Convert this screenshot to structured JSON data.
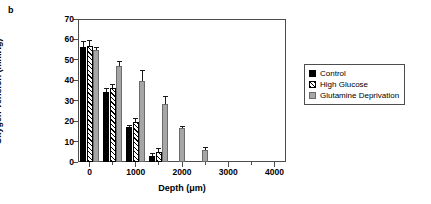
{
  "panel": {
    "label": "b"
  },
  "legend": {
    "position": "right",
    "entries": [
      {
        "label": "Control",
        "swatch": "solid-black-square-icon",
        "color": "#000000"
      },
      {
        "label": "High Glucose",
        "swatch": "hatched-square-icon",
        "color": "#ffffff"
      },
      {
        "label": "Glutamine Deprivation",
        "swatch": "gray-square-icon",
        "color": "#a6a6a6"
      }
    ]
  },
  "chart_data": {
    "type": "bar",
    "title": "",
    "subtitle": "",
    "xlabel": "Depth (μm)",
    "ylabel": "Oxygen Tension (mmHg)",
    "xlim": [
      -250,
      4250
    ],
    "ylim": [
      0,
      70
    ],
    "yticks": [
      0,
      10,
      20,
      30,
      40,
      50,
      60,
      70
    ],
    "ytick_labels": [
      "0",
      "10",
      "20",
      "30",
      "40",
      "50",
      "60",
      "70"
    ],
    "xticks": [
      0,
      1000,
      2000,
      3000,
      4000
    ],
    "xtick_labels": [
      "0",
      "1000",
      "2000",
      "3000",
      "4000"
    ],
    "xticks_minor": [
      500,
      1500,
      2500,
      3500
    ],
    "grid": false,
    "orientation": "vertical",
    "error_bars": "standard error",
    "categories": [
      0,
      500,
      1000,
      1500,
      2000,
      2500
    ],
    "category_labels": [
      "0",
      "500",
      "1000",
      "1500",
      "2000",
      "2500"
    ],
    "series": [
      {
        "name": "Control",
        "color": "#000000",
        "pattern": "solid",
        "values": [
          56.5,
          34.5,
          17.0,
          3.0,
          null,
          null
        ],
        "errors": [
          2.5,
          1.5,
          1.0,
          1.5,
          null,
          null
        ]
      },
      {
        "name": "High Glucose",
        "color": "#ffffff",
        "pattern": "diagonal-hatch",
        "values": [
          57.0,
          36.0,
          19.5,
          5.0,
          null,
          null
        ],
        "errors": [
          2.5,
          2.0,
          2.0,
          2.0,
          null,
          null
        ]
      },
      {
        "name": "Glutamine Deprivation",
        "color": "#a6a6a6",
        "pattern": "solid",
        "values": [
          55.0,
          47.0,
          39.5,
          28.5,
          16.5,
          6.0
        ],
        "errors": [
          1.5,
          2.5,
          5.5,
          4.0,
          1.0,
          1.5
        ]
      }
    ]
  }
}
